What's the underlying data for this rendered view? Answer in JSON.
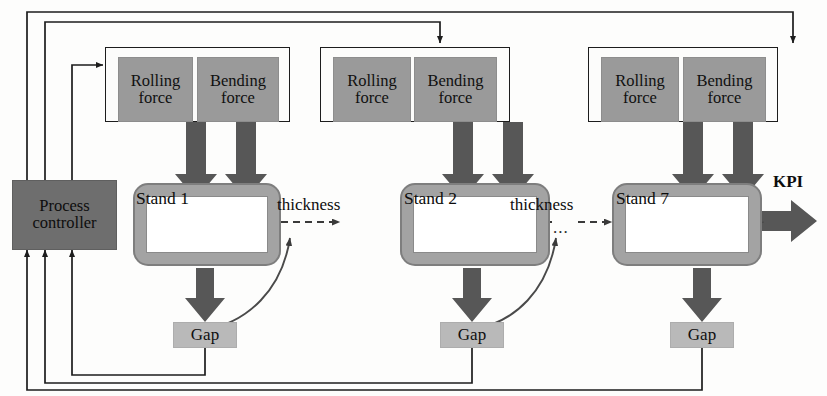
{
  "diagram": {
    "colors": {
      "force_box": "#9a9a9a",
      "controller_box": "#6e6e6e",
      "gap_box": "#b9b9b9",
      "stand_body": "#a3a3a3",
      "arrow": "#575757",
      "line": "#1d1d1d",
      "background": "#fdfdfc"
    },
    "controller": {
      "line1": "Process",
      "line2": "controller"
    },
    "output": {
      "label": "KPI"
    },
    "ellipsis": "...",
    "stands": [
      {
        "id": "stand-1",
        "label": "Stand 1",
        "gap_label": "Gap",
        "forces": [
          {
            "line1": "Rolling",
            "line2": "force"
          },
          {
            "line1": "Bending",
            "line2": "force"
          }
        ],
        "output_label": "thickness"
      },
      {
        "id": "stand-2",
        "label": "Stand 2",
        "gap_label": "Gap",
        "forces": [
          {
            "line1": "Rolling",
            "line2": "force"
          },
          {
            "line1": "Bending",
            "line2": "force"
          }
        ],
        "output_label": "thickness"
      },
      {
        "id": "stand-7",
        "label": "Stand 7",
        "gap_label": "Gap",
        "forces": [
          {
            "line1": "Rolling",
            "line2": "force"
          },
          {
            "line1": "Bending",
            "line2": "force"
          }
        ],
        "output_label": "KPI"
      }
    ]
  }
}
